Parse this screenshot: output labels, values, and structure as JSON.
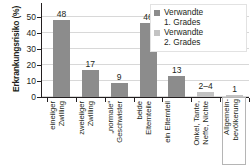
{
  "chart_data": {
    "type": "bar",
    "title": "",
    "xlabel": "",
    "ylabel": "Erkrankungsrisiko (%)",
    "ylim": [
      0,
      55
    ],
    "yticks": [
      "0",
      "10",
      "20",
      "30",
      "40",
      "50"
    ],
    "grid": true,
    "legend_position": "top-right",
    "categories": [
      "eineiiger\nZwilling",
      "zweieiiger\nZwilling",
      "„normale“\nGeschwister",
      "beide\nElternteile",
      "ein Elternteil",
      "Onkel, Tante,\nNeffe, Nichte",
      "Allgemein-\nbevölkerung"
    ],
    "values": [
      48,
      17,
      9,
      46,
      13,
      3,
      1
    ],
    "value_labels": [
      "48",
      "17",
      "9",
      "46",
      "13",
      "2–4",
      "1"
    ],
    "series_of_bar": [
      "deg1",
      "deg1",
      "deg1",
      "deg1",
      "deg1",
      "deg2",
      "deg2"
    ],
    "series": [
      {
        "name": "Verwandte\n1. Grades",
        "key": "deg1",
        "color": "#8c8c8c"
      },
      {
        "name": "Verwandte\n2. Grades",
        "key": "deg2",
        "color": "#c3c3c3"
      }
    ],
    "boxed_category_index": 6
  },
  "legend": {
    "items": [
      {
        "label": "Verwandte\n1. Grades"
      },
      {
        "label": "Verwandte\n2. Grades"
      }
    ]
  },
  "axis": {
    "y_title": "Erkrankungsrisiko (%)"
  },
  "colors": {
    "series_1": "#8c8c8c",
    "series_2": "#c3c3c3",
    "axis": "#231f20",
    "grid": "#d8d8d8",
    "background": "#ffffff"
  }
}
